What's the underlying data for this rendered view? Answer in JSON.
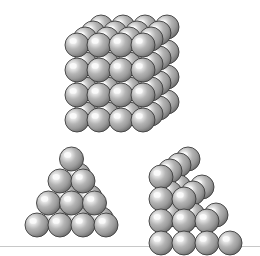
{
  "figure": {
    "background_color": "#ffffff",
    "width": 260,
    "height": 247
  },
  "sphere_style": {
    "highlight_color": "#f4f4f4",
    "mid_color": "#b4b4b4",
    "body_color": "#9a9a9a",
    "shade_color": "#6e6e6e",
    "outline_color": "#3c3c3c",
    "radius": 12,
    "highlight_offset_x": -0.32,
    "highlight_offset_y": -0.34
  },
  "structures": [
    {
      "id": "cubic-cluster",
      "name": "cubic-cluster",
      "label": "4x4x4 simple cubic cluster",
      "origin_x": 64,
      "origin_y": 14,
      "layout": "cube",
      "rows": 4,
      "cols": 4,
      "depth": 4,
      "sphere_count": 64,
      "dx": 22,
      "dy": 25,
      "depth_dx": 8,
      "depth_dy": -6
    },
    {
      "id": "square-pyramid-front",
      "name": "square-pyramid-front",
      "label": "Square pyramid, front elevation",
      "origin_x": 24,
      "origin_y": 146,
      "layout": "pyramid-front",
      "rows": 4,
      "base_count": 4,
      "sphere_count": 30,
      "dx": 23,
      "dy": 22,
      "depth_dx": 7,
      "depth_dy": -6
    },
    {
      "id": "stepped-pyramid-angled",
      "name": "stepped-pyramid-angled",
      "label": "Stepped pyramid, oblique view",
      "origin_x": 148,
      "origin_y": 146,
      "layout": "pyramid-oblique",
      "rows": 4,
      "base_count": 4,
      "sphere_count": 30,
      "dx": 23,
      "dy": 22,
      "depth_dx": 9,
      "depth_dy": -6
    }
  ]
}
